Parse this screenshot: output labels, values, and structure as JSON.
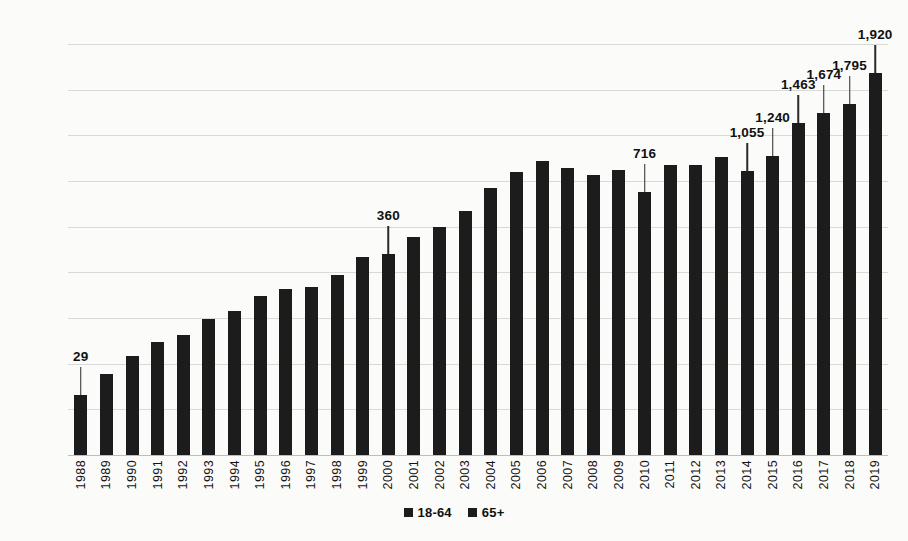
{
  "chart_data": {
    "type": "bar",
    "subtype": "stacked-column",
    "title": "",
    "xlabel": "",
    "ylabel": "",
    "ylim": [
      0,
      9000
    ],
    "ytick_step": 1000,
    "yticks": [
      "0",
      "1000",
      "2000",
      "3000",
      "4000",
      "5000",
      "6000",
      "7000",
      "8000",
      "9000"
    ],
    "grid": true,
    "legend_position": "bottom",
    "categories": [
      "1988",
      "1989",
      "1990",
      "1991",
      "1992",
      "1993",
      "1994",
      "1995",
      "1996",
      "1997",
      "1998",
      "1999",
      "2000",
      "2001",
      "2002",
      "2003",
      "2004",
      "2005",
      "2006",
      "2007",
      "2008",
      "2009",
      "2010",
      "2011",
      "2012",
      "2013",
      "2014",
      "2015",
      "2016",
      "2017",
      "2018",
      "2019"
    ],
    "series": [
      {
        "name": "18-64",
        "color": "#1c1c1c",
        "values": [
          1275,
          1725,
          2120,
          2395,
          2535,
          2880,
          3045,
          3355,
          3480,
          3500,
          3755,
          4110,
          4035,
          4495,
          4695,
          5005,
          5465,
          5760,
          5955,
          5775,
          5580,
          5635,
          5040,
          5665,
          5630,
          5775,
          5155,
          5300,
          5810,
          5810,
          5890,
          6440
        ]
      },
      {
        "name": "65+",
        "color": "#1c1c1c",
        "values": [
          29,
          40,
          55,
          70,
          85,
          100,
          115,
          130,
          150,
          170,
          195,
          225,
          360,
          275,
          300,
          330,
          380,
          430,
          480,
          520,
          560,
          600,
          716,
          680,
          710,
          760,
          1055,
          1240,
          1463,
          1674,
          1795,
          1920
        ]
      }
    ],
    "totals": [
      1304,
      1765,
      2175,
      2465,
      2620,
      2980,
      3160,
      3485,
      3630,
      3670,
      3950,
      4335,
      4395,
      4770,
      4995,
      5335,
      5845,
      6190,
      6435,
      6295,
      6140,
      6235,
      5756,
      6345,
      6340,
      6535,
      6210,
      6540,
      7273,
      7484,
      7685,
      8360
    ],
    "data_labels": [
      {
        "category": "1988",
        "value": 29,
        "text": "29"
      },
      {
        "category": "2000",
        "value": 360,
        "text": "360"
      },
      {
        "category": "2010",
        "value": 716,
        "text": "716"
      },
      {
        "category": "2014",
        "value": 1055,
        "text": "1,055"
      },
      {
        "category": "2015",
        "value": 1240,
        "text": "1,240"
      },
      {
        "category": "2016",
        "value": 1463,
        "text": "1,463"
      },
      {
        "category": "2017",
        "value": 1674,
        "text": "1,674"
      },
      {
        "category": "2018",
        "value": 1795,
        "text": "1,795"
      },
      {
        "category": "2019",
        "value": 1920,
        "text": "1,920"
      }
    ],
    "legend": [
      {
        "label": "18-64",
        "color": "#1c1c1c"
      },
      {
        "label": "65+",
        "color": "#1c1c1c"
      }
    ],
    "colors": {
      "background": "#fbfbfa",
      "gridline": "#d9d9d6",
      "bar": "#1c1c1c",
      "text": "#111111"
    }
  }
}
